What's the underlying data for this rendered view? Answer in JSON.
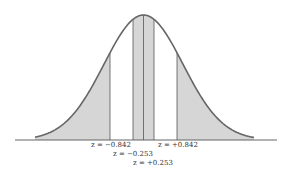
{
  "diagram": {
    "type": "normal-distribution",
    "colors": {
      "curve": "#666666",
      "shade": "#d6d6d6",
      "axis": "#555555",
      "divider": "#555555"
    },
    "regions": [
      {
        "name": "left-tail",
        "from_z": "-inf",
        "to_z": -0.842,
        "shaded": true
      },
      {
        "name": "left-middle",
        "from_z": -0.842,
        "to_z": -0.253,
        "shaded": false
      },
      {
        "name": "center-left",
        "from_z": -0.253,
        "to_z": 0,
        "shaded": true
      },
      {
        "name": "center-right",
        "from_z": 0,
        "to_z": 0.253,
        "shaded": true
      },
      {
        "name": "right-middle",
        "from_z": 0.253,
        "to_z": 0.842,
        "shaded": false
      },
      {
        "name": "right-tail",
        "from_z": 0.842,
        "to_z": "+inf",
        "shaded": true
      }
    ],
    "labels": {
      "neg_0842": "z = −0.842",
      "pos_0842": "z = +0.842",
      "neg_0253": "z = −0.253",
      "pos_0253": "z = +0.253"
    }
  }
}
